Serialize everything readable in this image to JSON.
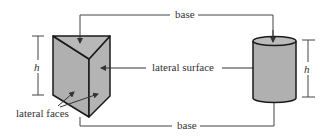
{
  "diagram": {
    "labels": {
      "base_top": "base",
      "base_bottom": "base",
      "lateral_surface": "lateral surface",
      "lateral_faces": "lateral faces",
      "height_left": "h",
      "height_right": "h"
    },
    "colors": {
      "fill": "#b0b0b0",
      "stroke": "#1a1a1a",
      "line": "#444444"
    },
    "shapes": [
      "triangular-prism",
      "cylinder"
    ]
  }
}
